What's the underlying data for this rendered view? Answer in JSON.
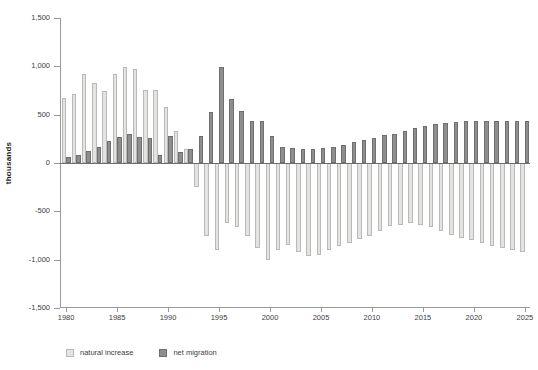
{
  "chart_data": {
    "type": "bar",
    "title": "",
    "subtitle": "",
    "xlabel": "",
    "ylabel": "thousands",
    "ylim": [
      -1500,
      1500
    ],
    "xlim": [
      1980,
      2025
    ],
    "grid": false,
    "legend_position": "bottom-left",
    "ytick_labels": [
      "1,500",
      "1,000",
      "500",
      "0",
      "-500",
      "-1,000",
      "-1,500"
    ],
    "ytick_values": [
      1500,
      1000,
      500,
      0,
      -500,
      -1000,
      -1500
    ],
    "xtick_labels": [
      "1980",
      "1985",
      "1990",
      "1995",
      "2000",
      "2005",
      "2010",
      "2015",
      "2020",
      "2025"
    ],
    "xtick_values": [
      1980,
      1985,
      1990,
      1995,
      2000,
      2005,
      2010,
      2015,
      2020,
      2025
    ],
    "categories": [
      1980,
      1981,
      1982,
      1983,
      1984,
      1985,
      1986,
      1987,
      1988,
      1989,
      1990,
      1991,
      1992,
      1993,
      1994,
      1995,
      1996,
      1997,
      1998,
      1999,
      2000,
      2001,
      2002,
      2003,
      2004,
      2005,
      2006,
      2007,
      2008,
      2009,
      2010,
      2011,
      2012,
      2013,
      2014,
      2015,
      2016,
      2017,
      2018,
      2019,
      2020,
      2021,
      2022,
      2023,
      2024,
      2025
    ],
    "series": [
      {
        "name": "natural increase",
        "color": "#e3e3e1",
        "values": [
          675,
          710,
          920,
          825,
          740,
          920,
          995,
          975,
          760,
          760,
          575,
          335,
          140,
          -250,
          -750,
          -900,
          -620,
          -660,
          -760,
          -880,
          -1000,
          -900,
          -850,
          -920,
          -960,
          -950,
          -900,
          -860,
          -830,
          -790,
          -750,
          -700,
          -650,
          -640,
          -620,
          -640,
          -660,
          -700,
          -740,
          -780,
          -800,
          -830,
          -860,
          -880,
          -900,
          -920
        ]
      },
      {
        "name": "net migration",
        "color": "#8e8e8e",
        "values": [
          65,
          80,
          125,
          170,
          230,
          265,
          300,
          270,
          255,
          85,
          280,
          110,
          140,
          275,
          530,
          990,
          660,
          535,
          430,
          430,
          275,
          165,
          155,
          150,
          150,
          155,
          170,
          190,
          215,
          235,
          260,
          285,
          300,
          330,
          360,
          385,
          405,
          415,
          425,
          430,
          430,
          430,
          430,
          430,
          430,
          430
        ]
      }
    ]
  },
  "legend": {
    "items": [
      {
        "label": "natural increase",
        "swatch": "nat"
      },
      {
        "label": "net migration",
        "swatch": "mig"
      }
    ]
  },
  "axis": {
    "y_axis_title": "thousands"
  }
}
